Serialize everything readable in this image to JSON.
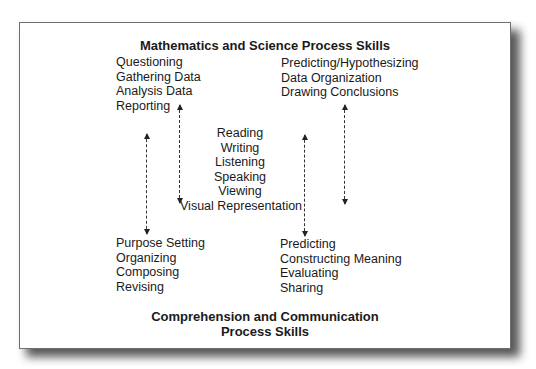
{
  "top_title": "Mathematics and Science Process Skills",
  "bottom_title": [
    "Comprehension and Communication",
    "Process Skills"
  ],
  "top_left": [
    "Questioning",
    "Gathering Data",
    "Analysis Data",
    "Reporting"
  ],
  "top_right": [
    "Predicting/Hypothesizing",
    "Data Organization",
    "Drawing Conclusions"
  ],
  "center": [
    "Reading",
    "Writing",
    "Listening",
    "Speaking",
    "Viewing",
    "Visual Representation"
  ],
  "bottom_left": [
    "Purpose Setting",
    "Organizing",
    "Composing",
    "Revising"
  ],
  "bottom_right": [
    "Predicting",
    "Constructing Meaning",
    "Evaluating",
    "Sharing"
  ],
  "arrows": [
    {
      "name": "left-outer",
      "direction": "both"
    },
    {
      "name": "left-inner",
      "direction": "both"
    },
    {
      "name": "right-inner",
      "direction": "both"
    },
    {
      "name": "right-outer",
      "direction": "both"
    }
  ]
}
